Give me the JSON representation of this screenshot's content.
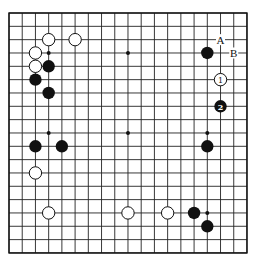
{
  "board": {
    "size": 19,
    "origin_x": 9,
    "origin_y": 13,
    "spacing_x": 13.22,
    "spacing_y": 13.33,
    "stone_radius": 6.2,
    "hoshi": [
      [
        3,
        3
      ],
      [
        9,
        3
      ],
      [
        15,
        3
      ],
      [
        3,
        9
      ],
      [
        9,
        9
      ],
      [
        15,
        9
      ],
      [
        3,
        15
      ],
      [
        9,
        15
      ],
      [
        15,
        15
      ]
    ]
  },
  "stones": [
    {
      "color": "white",
      "col": 3,
      "row": 2
    },
    {
      "color": "white",
      "col": 5,
      "row": 2
    },
    {
      "color": "white",
      "col": 2,
      "row": 3
    },
    {
      "color": "white",
      "col": 2,
      "row": 4
    },
    {
      "color": "black",
      "col": 3,
      "row": 4
    },
    {
      "color": "black",
      "col": 2,
      "row": 5
    },
    {
      "color": "black",
      "col": 3,
      "row": 6
    },
    {
      "color": "black",
      "col": 15,
      "row": 3
    },
    {
      "color": "white",
      "col": 16,
      "row": 5,
      "label": "1"
    },
    {
      "color": "black",
      "col": 16,
      "row": 7,
      "label": "2"
    },
    {
      "color": "black",
      "col": 2,
      "row": 10
    },
    {
      "color": "black",
      "col": 4,
      "row": 10
    },
    {
      "color": "black",
      "col": 15,
      "row": 10
    },
    {
      "color": "white",
      "col": 2,
      "row": 12
    },
    {
      "color": "white",
      "col": 3,
      "row": 15
    },
    {
      "color": "white",
      "col": 9,
      "row": 15
    },
    {
      "color": "white",
      "col": 12,
      "row": 15
    },
    {
      "color": "black",
      "col": 14,
      "row": 15
    },
    {
      "color": "black",
      "col": 15,
      "row": 16
    }
  ],
  "markers": [
    {
      "text": "A",
      "col": 16,
      "row": 2
    },
    {
      "text": "B",
      "col": 17,
      "row": 3
    }
  ]
}
